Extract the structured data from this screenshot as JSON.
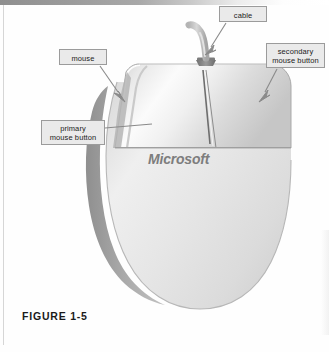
{
  "figure": {
    "caption": "FIGURE 1-5",
    "brand_text": "Microsoft"
  },
  "callouts": [
    {
      "id": "cable",
      "label": "cable",
      "leader": "arrow",
      "points_to": "mouse-cable"
    },
    {
      "id": "secondary-mouse-button",
      "label": "secondary\nmouse button",
      "leader": "arrow",
      "points_to": "right-mouse-button"
    },
    {
      "id": "mouse",
      "label": "mouse",
      "leader": "arrow",
      "points_to": "mouse-body-left-edge"
    },
    {
      "id": "primary-mouse-button",
      "label": "primary\nmouse button",
      "leader": "line",
      "points_to": "left-mouse-button"
    }
  ],
  "colors": {
    "page_background": "#fefefe",
    "label_fill": "#eaeaea",
    "label_border": "#9b9b9b",
    "label_text": "#1c1c1c",
    "leader_line": "#8a8a8a",
    "mouse_body_light": "#eeeeee",
    "mouse_body_mid": "#d8d8d8",
    "mouse_shadow": "#9c9c9c",
    "brand_text": "#7d7d7d",
    "caption_text": "#1a1a1a",
    "scan_band": "#9a9a9a"
  }
}
